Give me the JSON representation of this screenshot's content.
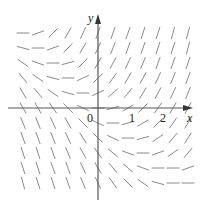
{
  "figure": {
    "type": "slope_field",
    "axes": {
      "x_label": "x",
      "y_label": "y",
      "origin_label": "0",
      "x_ticks": [
        {
          "value": 1,
          "label": "1"
        },
        {
          "value": 2,
          "label": "2"
        }
      ]
    },
    "colors": {
      "segment": "#8a8a8a",
      "axis": "#555555",
      "text": "#222222",
      "background": "#ffffff"
    },
    "grid": {
      "columns_px": [
        23,
        38,
        53,
        68,
        83,
        98,
        113,
        128,
        143,
        158,
        173,
        188
      ],
      "rows_px": [
        33,
        48,
        63,
        78,
        93,
        108,
        123,
        138,
        153,
        168,
        183
      ],
      "segment_half_length_px": 6,
      "slopes_deg": [
        [
          0,
          20,
          45,
          60,
          65,
          70,
          70,
          70,
          72,
          72,
          75,
          75
        ],
        [
          -15,
          0,
          20,
          45,
          60,
          65,
          68,
          70,
          70,
          72,
          72,
          75
        ],
        [
          -35,
          -20,
          0,
          15,
          45,
          60,
          62,
          65,
          68,
          70,
          70,
          72
        ],
        [
          -50,
          -35,
          -15,
          0,
          25,
          45,
          55,
          60,
          62,
          65,
          68,
          70
        ],
        [
          -60,
          -50,
          -35,
          -15,
          0,
          25,
          40,
          50,
          58,
          62,
          65,
          68
        ],
        [
          -60,
          -60,
          -55,
          -45,
          -25,
          0,
          15,
          30,
          45,
          55,
          60,
          62
        ],
        [
          -68,
          -68,
          -65,
          -60,
          -45,
          -25,
          0,
          15,
          30,
          45,
          55,
          60
        ],
        [
          -70,
          -70,
          -68,
          -65,
          -58,
          -45,
          -25,
          0,
          15,
          35,
          50,
          58
        ],
        [
          -72,
          -72,
          -70,
          -68,
          -62,
          -55,
          -40,
          -20,
          0,
          20,
          35,
          50
        ],
        [
          -72,
          -72,
          -70,
          -70,
          -65,
          -60,
          -50,
          -40,
          -20,
          0,
          0,
          20
        ],
        [
          -75,
          -72,
          -72,
          -70,
          -68,
          -65,
          -55,
          -45,
          -35,
          -15,
          0,
          0
        ]
      ]
    }
  }
}
